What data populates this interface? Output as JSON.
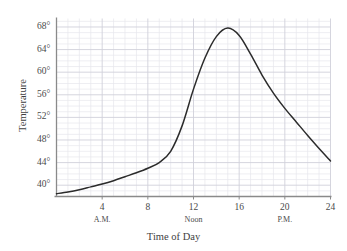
{
  "chart_data": {
    "type": "line",
    "title": "",
    "xlabel": "Time of Day",
    "ylabel": "Temperature",
    "xlim": [
      0,
      24
    ],
    "ylim": [
      38,
      69.5
    ],
    "grid": true,
    "legend": "none",
    "x_ticks": [
      4,
      8,
      12,
      16,
      20,
      24
    ],
    "x_tick_labels": [
      "4",
      "8",
      "12",
      "16",
      "20",
      "24"
    ],
    "x_sub_labels": [
      {
        "text": "A.M.",
        "at": 4
      },
      {
        "text": "Noon",
        "at": 12
      },
      {
        "text": "P.M.",
        "at": 20
      }
    ],
    "y_ticks": [
      40,
      44,
      48,
      52,
      56,
      60,
      64,
      68
    ],
    "y_tick_labels": [
      "40°",
      "44°",
      "48°",
      "52°",
      "56°",
      "60°",
      "64°",
      "68°"
    ],
    "series": [
      {
        "name": "Temperature",
        "color": "#2b2b2b",
        "x": [
          0,
          1,
          2,
          3,
          4,
          5,
          6,
          7,
          8,
          9,
          10,
          11,
          12,
          13,
          14,
          15,
          16,
          17,
          18,
          19,
          20,
          21,
          22,
          23,
          24
        ],
        "values": [
          38.5,
          38.8,
          39.2,
          39.7,
          40.2,
          40.8,
          41.5,
          42.2,
          43.0,
          44.0,
          46.0,
          50.5,
          57.0,
          62.5,
          66.3,
          67.8,
          66.5,
          63.2,
          59.5,
          56.3,
          53.6,
          51.2,
          48.8,
          46.5,
          44.3
        ]
      }
    ],
    "peak": {
      "hour": 15,
      "temperature": 67.8
    },
    "colors": {
      "curve": "#2b2b2b",
      "axis": "#8a8a8a",
      "grid_minor": "#e6e6ec",
      "grid_major": "#d0d0da",
      "text": "#4a4a4a",
      "background": "#ffffff"
    }
  }
}
